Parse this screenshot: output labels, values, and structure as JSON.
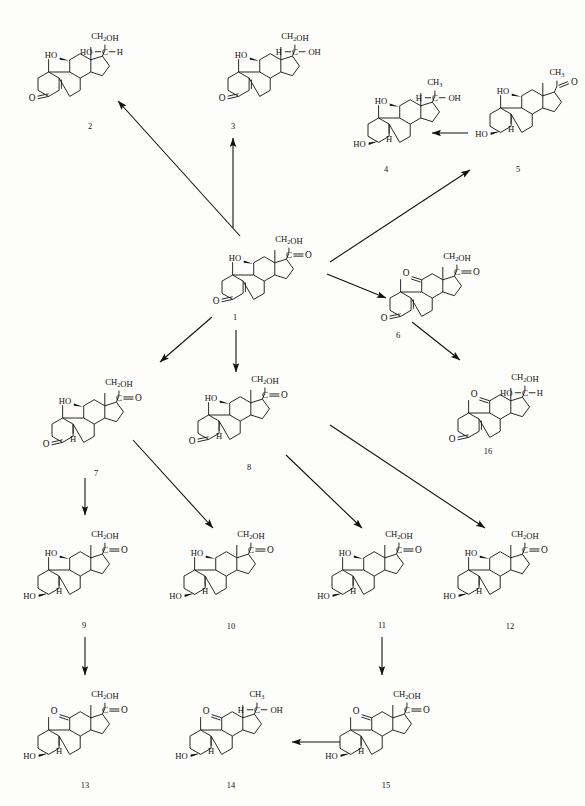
{
  "figure": {
    "type": "chemical-reaction-scheme",
    "background_color": "#fdfdfb",
    "line_color": "#111111",
    "width": 585,
    "height": 806
  },
  "compounds": [
    {
      "id": "1",
      "number_label": "1",
      "x": 268,
      "y": 265,
      "name": "cortisol",
      "side_chain": "CH2OH / C=O",
      "substituents": [
        "HO (C11)",
        "O (C3)"
      ],
      "ring_a": "delta4-3-one"
    },
    {
      "id": "2",
      "number_label": "2",
      "x": 90,
      "y": 72,
      "name": "20beta-dihydrocortisol",
      "side_chain": "CH2OH / HO-C-H",
      "substituents": [
        "HO (C11)",
        "O (C3)"
      ],
      "ring_a": "delta4-3-one"
    },
    {
      "id": "3",
      "number_label": "3",
      "x": 235,
      "y": 72,
      "name": "20alpha-dihydrocortisol",
      "side_chain": "CH2OH / H-C-OH",
      "substituents": [
        "HO (C11)",
        "O (C3)"
      ],
      "ring_a": "delta4-3-one"
    },
    {
      "id": "4",
      "number_label": "4",
      "x": 405,
      "y": 108,
      "name": "20-hydroxy-5beta-pregnane-3,11-diol",
      "side_chain": "CH3 / H-C-OH",
      "substituents": [
        "HO (C11)",
        "HO (C3)",
        "H (C5)"
      ],
      "ring_a": "saturated"
    },
    {
      "id": "5",
      "number_label": "5",
      "x": 510,
      "y": 95,
      "name": "5beta-pregnane-3,11-diol-20-one",
      "side_chain": "CH3 / C=O",
      "substituents": [
        "HO (C11)",
        "HO (C3)",
        "H (C5)"
      ],
      "ring_a": "saturated"
    },
    {
      "id": "6",
      "number_label": "6",
      "x": 432,
      "y": 272,
      "name": "cortisone",
      "side_chain": "CH2OH / C=O",
      "substituents": [
        "O (C11)",
        "O (C3)"
      ],
      "ring_a": "delta4-3-one"
    },
    {
      "id": "7",
      "number_label": "7",
      "x": 110,
      "y": 410,
      "name": "tetrahydrocortisol",
      "side_chain": "CH2OH / C=O",
      "substituents": [
        "HO (C11)",
        "O (C3)",
        "H (C5)"
      ],
      "ring_a": "3-one saturated"
    },
    {
      "id": "8",
      "number_label": "8",
      "x": 258,
      "y": 408,
      "name": "allo-tetrahydrocortisol",
      "side_chain": "CH2OH / C=O",
      "substituents": [
        "HO (C11)",
        "O (C3)",
        "H (C5)"
      ],
      "ring_a": "3-one saturated"
    },
    {
      "id": "9",
      "number_label": "9",
      "x": 85,
      "y": 562,
      "name": "3alpha,11beta-dihydroxy-pregnan-20-one",
      "side_chain": "CH2OH / C=O",
      "substituents": [
        "HO (C11)",
        "HO (C3)",
        "H (C5)"
      ],
      "ring_a": "saturated"
    },
    {
      "id": "10",
      "number_label": "10",
      "x": 228,
      "y": 562,
      "name": "tetrahydrocortisol isomer",
      "side_chain": "CH2OH / C=O",
      "substituents": [
        "HO (C11)",
        "HO (C3)",
        "H (C5)"
      ],
      "ring_a": "saturated"
    },
    {
      "id": "11",
      "number_label": "11",
      "x": 372,
      "y": 562,
      "name": "tetrahydrocortisol isomer",
      "side_chain": "CH2OH / C=O",
      "substituents": [
        "HO (C11)",
        "HO (C3)",
        "H (C5)"
      ],
      "ring_a": "saturated"
    },
    {
      "id": "12",
      "number_label": "12",
      "x": 490,
      "y": 562,
      "name": "tetrahydrocortisol isomer",
      "side_chain": "CH2OH / C=O",
      "substituents": [
        "HO (C11)",
        "HO (C3)",
        "H (C5)"
      ],
      "ring_a": "saturated"
    },
    {
      "id": "13",
      "number_label": "13",
      "x": 85,
      "y": 720,
      "name": "tetrahydrocortisone",
      "side_chain": "CH2OH / C=O",
      "substituents": [
        "O (C11)",
        "HO (C3)",
        "H (C5)"
      ],
      "ring_a": "saturated"
    },
    {
      "id": "14",
      "number_label": "14",
      "x": 238,
      "y": 720,
      "name": "beta-cortolone",
      "side_chain": "CH3 / H-C-OH",
      "substituents": [
        "O (C11)",
        "HO (C3)",
        "H (C5)"
      ],
      "ring_a": "saturated"
    },
    {
      "id": "15",
      "number_label": "15",
      "x": 395,
      "y": 720,
      "name": "tetrahydrocortisone isomer",
      "side_chain": "CH2OH / C=O",
      "substituents": [
        "O (C11)",
        "HO (C3)",
        "H (C5)"
      ],
      "ring_a": "saturated"
    },
    {
      "id": "16",
      "number_label": "16",
      "x": 492,
      "y": 395,
      "name": "20-dihydrocortisone",
      "side_chain": "CH2OH / HO-C-H",
      "substituents": [
        "O (C11)",
        "O (C3)"
      ],
      "ring_a": "delta4-3-one"
    }
  ],
  "number_labels": [
    {
      "text": "1",
      "x": 235,
      "y": 320
    },
    {
      "text": "2",
      "x": 90,
      "y": 129
    },
    {
      "text": "3",
      "x": 233,
      "y": 129
    },
    {
      "text": "4",
      "x": 386,
      "y": 172
    },
    {
      "text": "5",
      "x": 518,
      "y": 172
    },
    {
      "text": "6",
      "x": 398,
      "y": 338
    },
    {
      "text": "7",
      "x": 96,
      "y": 476
    },
    {
      "text": "8",
      "x": 249,
      "y": 470
    },
    {
      "text": "9",
      "x": 84,
      "y": 628
    },
    {
      "text": "10",
      "x": 231,
      "y": 629
    },
    {
      "text": "11",
      "x": 382,
      "y": 628
    },
    {
      "text": "12",
      "x": 510,
      "y": 629
    },
    {
      "text": "13",
      "x": 85,
      "y": 788
    },
    {
      "text": "14",
      "x": 231,
      "y": 788
    },
    {
      "text": "15",
      "x": 386,
      "y": 788
    },
    {
      "text": "16",
      "x": 488,
      "y": 454
    }
  ],
  "reactions": [
    {
      "from": "1",
      "to": "2",
      "arrow": "diagonal-up-left",
      "x1": 240,
      "y1": 236,
      "x2": 118,
      "y2": 101
    },
    {
      "from": "1",
      "to": "3",
      "arrow": "vertical-up",
      "x1": 233,
      "y1": 228,
      "x2": 233,
      "y2": 138
    },
    {
      "from": "1",
      "to": "5",
      "arrow": "diagonal-up-right",
      "x1": 330,
      "y1": 262,
      "x2": 470,
      "y2": 170
    },
    {
      "from": "1",
      "to": "6",
      "arrow": "diagonal-down-right",
      "x1": 327,
      "y1": 274,
      "x2": 386,
      "y2": 298
    },
    {
      "from": "1",
      "to": "7",
      "arrow": "diagonal-down-left",
      "x1": 212,
      "y1": 317,
      "x2": 160,
      "y2": 362
    },
    {
      "from": "1",
      "to": "8",
      "arrow": "vertical-down",
      "x1": 236,
      "y1": 330,
      "x2": 236,
      "y2": 372
    },
    {
      "from": "5",
      "to": "4",
      "arrow": "horizontal-left",
      "x1": 468,
      "y1": 133,
      "x2": 432,
      "y2": 133
    },
    {
      "from": "6",
      "to": "16",
      "arrow": "diagonal-down-right",
      "x1": 412,
      "y1": 322,
      "x2": 460,
      "y2": 360
    },
    {
      "from": "7",
      "to": "9",
      "arrow": "vertical-down",
      "x1": 85,
      "y1": 478,
      "x2": 85,
      "y2": 515
    },
    {
      "from": "7",
      "to": "10",
      "arrow": "diagonal-down-right",
      "x1": 133,
      "y1": 440,
      "x2": 213,
      "y2": 528
    },
    {
      "from": "8",
      "to": "11",
      "arrow": "diagonal-down-right",
      "x1": 286,
      "y1": 455,
      "x2": 362,
      "y2": 528
    },
    {
      "from": "8",
      "to": "12",
      "arrow": "diagonal-down-right",
      "x1": 330,
      "y1": 425,
      "x2": 485,
      "y2": 528
    },
    {
      "from": "9",
      "to": "13",
      "arrow": "vertical-down",
      "x1": 85,
      "y1": 637,
      "x2": 85,
      "y2": 675
    },
    {
      "from": "11",
      "to": "15",
      "arrow": "vertical-down",
      "x1": 382,
      "y1": 637,
      "x2": 382,
      "y2": 675
    },
    {
      "from": "15",
      "to": "14",
      "arrow": "horizontal-left",
      "x1": 340,
      "y1": 742,
      "x2": 292,
      "y2": 742
    },
    {
      "from": "1",
      "to": "16",
      "arrow": "none",
      "x1": 0,
      "y1": 0,
      "x2": 0,
      "y2": 0
    }
  ],
  "atom_labels": {
    "ho": "HO",
    "oh": "OH",
    "o": "O",
    "h": "H",
    "c": "C",
    "ch2oh_main": "CH",
    "ch2oh_sub": "2",
    "ch2oh_tail": "OH",
    "ch3_main": "CH",
    "ch3_sub": "3"
  }
}
